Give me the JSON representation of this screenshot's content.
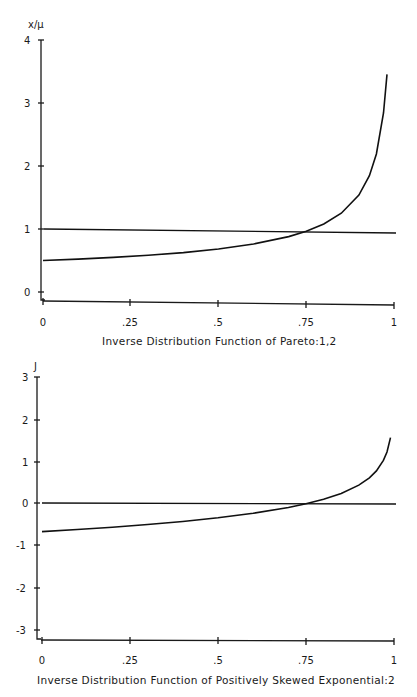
{
  "chart_data": [
    {
      "type": "line",
      "title": "Inverse Distribution Function of Pareto:1,2",
      "xlabel": "Inverse Distribution Function of Pareto:1,2",
      "ylabel": "x/μ",
      "xlim": [
        0,
        1
      ],
      "ylim": [
        0,
        4
      ],
      "x_ticks": [
        "0",
        ".25",
        ".5",
        ".75",
        "1"
      ],
      "y_ticks": [
        "0",
        "1",
        "2",
        "3",
        "4"
      ],
      "grid": false,
      "legend": null,
      "series": [
        {
          "name": "Pareto inverse distribution (x/μ)",
          "x": [
            0,
            0.1,
            0.2,
            0.3,
            0.4,
            0.5,
            0.6,
            0.7,
            0.75,
            0.8,
            0.85,
            0.9,
            0.93,
            0.95,
            0.97,
            0.98
          ],
          "values": [
            0.5,
            0.527,
            0.559,
            0.598,
            0.645,
            0.707,
            0.791,
            0.913,
            1.0,
            1.118,
            1.291,
            1.581,
            1.89,
            2.236,
            2.887,
            3.5
          ]
        },
        {
          "name": "Mean reference line",
          "x": [
            0,
            1
          ],
          "values": [
            1.0,
            0.95
          ]
        }
      ]
    },
    {
      "type": "line",
      "title": "Inverse Distribution Function of Positively Skewed Exponential:2",
      "xlabel": "Inverse Distribution Function of Positively Skewed Exponential:2",
      "ylabel": "J",
      "xlim": [
        0,
        1
      ],
      "ylim": [
        -3,
        3
      ],
      "x_ticks": [
        "0",
        ".25",
        ".5",
        ".75",
        "1"
      ],
      "y_ticks": [
        "-3",
        "-2",
        "-1",
        "0",
        "1",
        "2",
        "3"
      ],
      "grid": false,
      "legend": null,
      "series": [
        {
          "name": "Positively skewed exponential inverse distribution (J)",
          "x": [
            0,
            0.1,
            0.2,
            0.3,
            0.4,
            0.5,
            0.6,
            0.7,
            0.75,
            0.8,
            0.85,
            0.9,
            0.93,
            0.95,
            0.97,
            0.98,
            0.99
          ],
          "values": [
            -0.68,
            -0.628,
            -0.571,
            -0.505,
            -0.43,
            -0.34,
            -0.231,
            -0.09,
            0.0,
            0.109,
            0.25,
            0.448,
            0.623,
            0.788,
            1.038,
            1.237,
            1.58
          ]
        },
        {
          "name": "Zero reference line",
          "x": [
            0,
            1
          ],
          "values": [
            0,
            0
          ]
        }
      ]
    }
  ],
  "charts": [
    {
      "ylabel": "x/μ",
      "xtitle": "Inverse Distribution Function of Pareto:1,2",
      "xticks": [
        "0",
        ".25",
        ".5",
        ".75",
        "1"
      ],
      "yticks": [
        "0",
        "1",
        "2",
        "3",
        "4"
      ]
    },
    {
      "ylabel": "J",
      "xtitle": "Inverse Distribution Function of Positively Skewed Exponential:2",
      "xticks": [
        "0",
        ".25",
        ".5",
        ".75",
        "1"
      ],
      "yticks": [
        "-3",
        "-2",
        "-1",
        "0",
        "1",
        "2",
        "3"
      ]
    }
  ]
}
